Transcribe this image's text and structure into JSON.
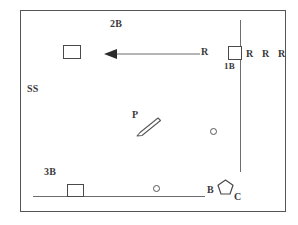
{
  "diagram": {
    "background_color": "#ffffff",
    "border_color": "#555555",
    "line_color": "#6d6d6d",
    "ink_color": "#3a3a3a",
    "labels": {
      "second_base": "2B",
      "first_base": "1B",
      "third_base": "3B",
      "shortstop": "SS",
      "pitcher": "P",
      "batter": "B",
      "catcher": "C",
      "runner_on_path": "R",
      "runner_right_1": "R",
      "runner_right_2": "R",
      "runner_right_3": "R"
    },
    "shapes": {
      "base_second": "square-base-marker",
      "base_first": "square-base-marker",
      "base_third": "square-base-marker",
      "home_plate": "pentagon-home-plate",
      "ball_infield_right": "open-circle-marker",
      "ball_near_baseline": "open-circle-marker",
      "bat": "diagonal-bat-shape",
      "arrow": "leftward-motion-arrow",
      "foul_line": "vertical-foul-line",
      "baseline": "horizontal-baseline"
    }
  }
}
